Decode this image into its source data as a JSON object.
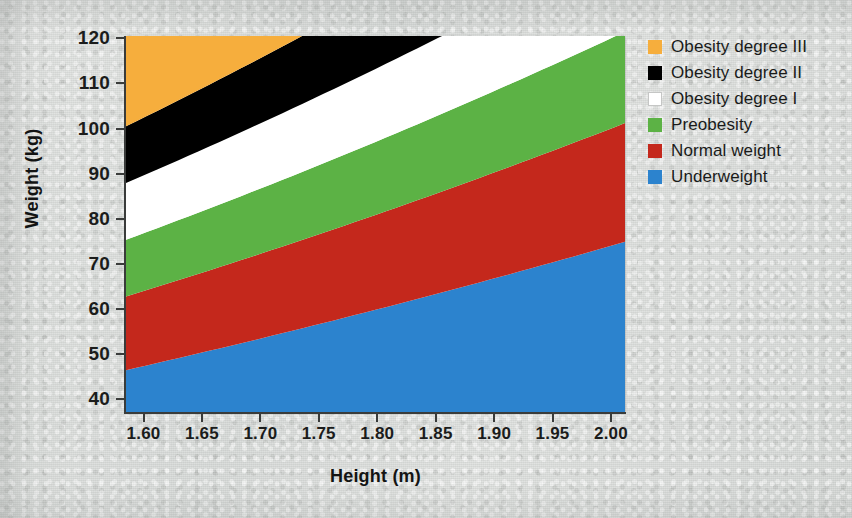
{
  "figure": {
    "background_color": "#d6d9d7"
  },
  "axes": {
    "x": {
      "title": "Height (m)",
      "tick_labels": [
        "1.60",
        "1.65",
        "1.70",
        "1.75",
        "1.80",
        "1.85",
        "1.90",
        "1.95",
        "2.00"
      ],
      "tick_values": [
        1.6,
        1.65,
        1.7,
        1.75,
        1.8,
        1.85,
        1.9,
        1.95,
        2.0
      ],
      "min": 1.585,
      "max": 2.012
    },
    "y": {
      "title": "Weight (kg)",
      "tick_labels": [
        "120",
        "110",
        "100",
        "90",
        "80",
        "70",
        "60",
        "50",
        "40"
      ],
      "tick_values": [
        120,
        110,
        100,
        90,
        80,
        70,
        60,
        50,
        40
      ],
      "min": 37.2,
      "max": 120.5
    }
  },
  "legend": {
    "items": [
      {
        "label": "Obesity degree III",
        "color": "#f6ae3d",
        "outlined": false
      },
      {
        "label": "Obesity degree II",
        "color": "#000000",
        "outlined": false
      },
      {
        "label": "Obesity degree I",
        "color": "#ffffff",
        "outlined": true
      },
      {
        "label": "Preobesity",
        "color": "#5cb245",
        "outlined": false
      },
      {
        "label": "Normal weight",
        "color": "#c4281c",
        "outlined": false
      },
      {
        "label": "Underweight",
        "color": "#2c83ce",
        "outlined": false
      }
    ]
  },
  "chart_data": {
    "type": "area",
    "title": "",
    "xlabel": "Height (m)",
    "ylabel": "Weight (kg)",
    "xlim": [
      1.585,
      2.012
    ],
    "ylim": [
      37.2,
      120.5
    ],
    "grid": false,
    "legend_position": "right",
    "boundaries": [
      {
        "name": "underweight / normal weight",
        "bmi": 18.5,
        "weight_at_min_height": 46.5,
        "weight_at_max_height": 74.9
      },
      {
        "name": "normal weight / preobesity",
        "bmi": 25.0,
        "weight_at_min_height": 62.8,
        "weight_at_max_height": 101.2
      },
      {
        "name": "preobesity / obesity I",
        "bmi": 30.0,
        "weight_at_min_height": 75.4,
        "weight_at_max_height": 121.4
      },
      {
        "name": "obesity I / obesity II",
        "bmi": 35.0,
        "weight_at_min_height": 87.9,
        "weight_at_max_height": 141.7
      },
      {
        "name": "obesity II / obesity III",
        "bmi": 40.0,
        "weight_at_min_height": 100.5,
        "weight_at_max_height": 161.9
      }
    ],
    "series": [
      {
        "name": "Underweight",
        "bmi_range": [
          0,
          18.5
        ],
        "color": "#2c83ce"
      },
      {
        "name": "Normal weight",
        "bmi_range": [
          18.5,
          25.0
        ],
        "color": "#c4281c"
      },
      {
        "name": "Preobesity",
        "bmi_range": [
          25.0,
          30.0
        ],
        "color": "#5cb245"
      },
      {
        "name": "Obesity degree I",
        "bmi_range": [
          30.0,
          35.0
        ],
        "color": "#ffffff"
      },
      {
        "name": "Obesity degree II",
        "bmi_range": [
          35.0,
          40.0
        ],
        "color": "#000000"
      },
      {
        "name": "Obesity degree III",
        "bmi_range": [
          40.0,
          999
        ],
        "color": "#f6ae3d"
      }
    ]
  }
}
